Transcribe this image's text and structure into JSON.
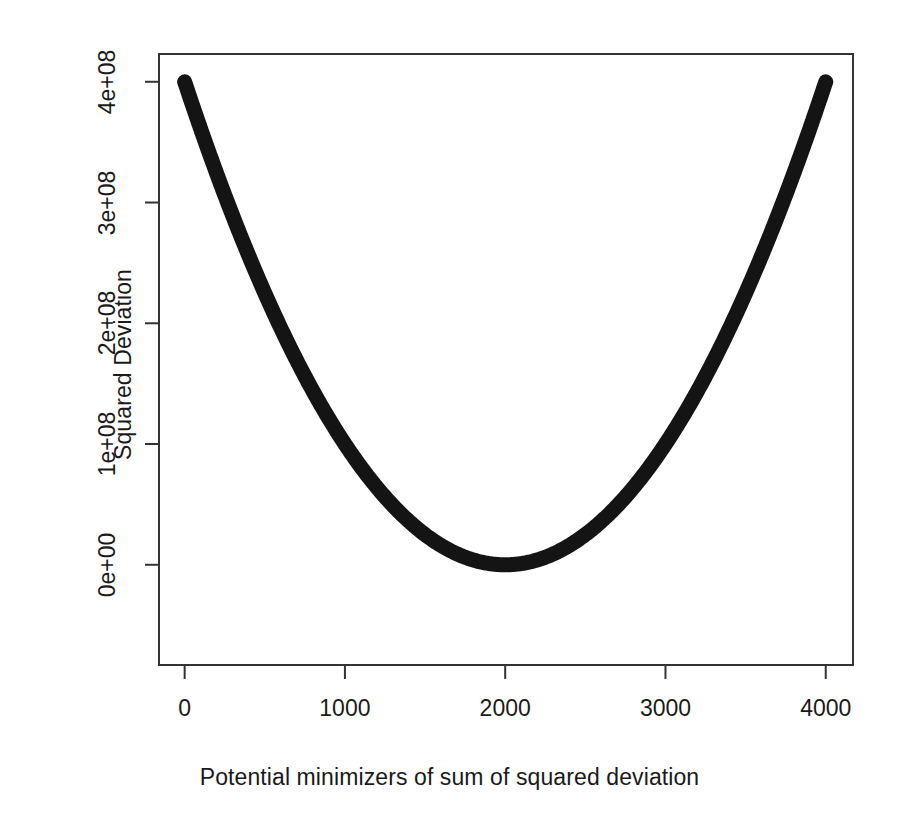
{
  "chart_data": {
    "type": "line",
    "title": "",
    "xlabel": "Potential minimizers of sum of squared deviation",
    "ylabel": "Squared Deviation",
    "xlim": [
      -160,
      4170
    ],
    "ylim": [
      -83000000,
      423000000
    ],
    "xticks": [
      0,
      1000,
      2000,
      3000,
      4000
    ],
    "xticklabels": [
      "0",
      "1000",
      "2000",
      "3000",
      "4000"
    ],
    "yticks": [
      0,
      100000000,
      200000000,
      300000000,
      400000000
    ],
    "yticklabels": [
      "0e+00",
      "1e+08",
      "2e+08",
      "3e+08",
      "4e+08"
    ],
    "grid": false,
    "legend": null,
    "line_color": "#141414",
    "line_width": 15,
    "axis_color": "#333333",
    "background": "#ffffff",
    "series": [
      {
        "name": "sum of squared deviation",
        "description": "Parabola with minimum at x = 2000, value 0; rises to 4e+08 at x = 0 and x = 4000",
        "minimizer_x": 2000,
        "minimum_y": 0,
        "x": [
          0,
          100,
          200,
          300,
          400,
          500,
          600,
          700,
          800,
          900,
          1000,
          1100,
          1200,
          1300,
          1400,
          1500,
          1600,
          1700,
          1800,
          1900,
          2000,
          2100,
          2200,
          2300,
          2400,
          2500,
          2600,
          2700,
          2800,
          2900,
          3000,
          3100,
          3200,
          3300,
          3400,
          3500,
          3600,
          3700,
          3800,
          3900,
          4000
        ],
        "y": [
          400000000,
          361000000,
          324000000,
          289000000,
          256000000,
          225000000,
          196000000,
          169000000,
          144000000,
          121000000,
          100000000,
          81000000,
          64000000,
          49000000,
          36000000,
          25000000,
          16000000,
          9000000,
          4000000,
          1000000,
          0,
          1000000,
          4000000,
          9000000,
          16000000,
          25000000,
          36000000,
          49000000,
          64000000,
          81000000,
          100000000,
          121000000,
          144000000,
          169000000,
          196000000,
          225000000,
          256000000,
          289000000,
          324000000,
          361000000,
          400000000
        ]
      }
    ]
  },
  "plot_box": {
    "left": 159,
    "right": 853,
    "top": 54,
    "bottom": 665
  }
}
